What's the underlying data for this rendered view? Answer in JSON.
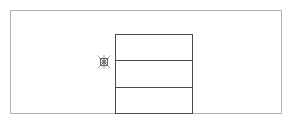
{
  "diagram": {
    "canvas": {
      "border_color": "#b4b4b4",
      "background": "#ffffff"
    },
    "shape": {
      "type": "stacked-rectangle",
      "sections": 3,
      "stroke_color": "#4a4a4a",
      "section_labels": [
        "",
        "",
        ""
      ]
    },
    "handle": {
      "icon": "anchor-crosshair-icon",
      "position": "left-middle",
      "color": "#666666"
    }
  }
}
